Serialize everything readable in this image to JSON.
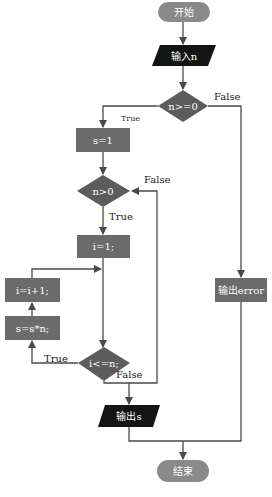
{
  "colors": {
    "terminal": "#8a8a8a",
    "process": "#6b6b6b",
    "decision": "#5c5c5c",
    "io": "#141414",
    "line": "#4a4a4a",
    "background": "#ffffff"
  },
  "nodes": {
    "start": {
      "label": "开始",
      "type": "terminal"
    },
    "input_n": {
      "label": "输入n",
      "type": "io"
    },
    "cond_n_ge_0": {
      "label": "n>=0",
      "type": "decision"
    },
    "s_init": {
      "label": "s=1",
      "type": "process"
    },
    "cond_n_gt_0": {
      "label": "n>0",
      "type": "decision"
    },
    "i_init": {
      "label": "i=1;",
      "type": "process"
    },
    "i_inc": {
      "label": "i=i+1;",
      "type": "process"
    },
    "s_mul": {
      "label": "s=s*n;",
      "type": "process"
    },
    "cond_i_le_n": {
      "label": "i<=n;",
      "type": "decision"
    },
    "output_s": {
      "label": "输出s",
      "type": "io"
    },
    "output_error": {
      "label": "输出error",
      "type": "process"
    },
    "end": {
      "label": "结束",
      "type": "terminal"
    }
  },
  "edge_labels": {
    "n_ge_0_true": "True",
    "n_ge_0_false": "False",
    "n_gt_0_true": "True",
    "n_gt_0_false": "False",
    "i_le_n_true": "True",
    "i_le_n_false": "False"
  }
}
